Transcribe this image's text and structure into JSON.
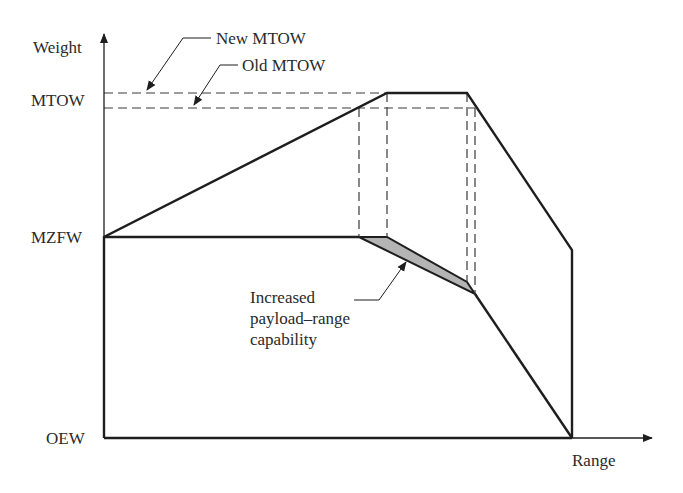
{
  "diagram": {
    "axes": {
      "y_label": "Weight",
      "x_label": "Range",
      "y_ticks": [
        "MTOW",
        "MZFW",
        "OEW"
      ]
    },
    "annotations": {
      "new_mtow": "New MTOW",
      "old_mtow": "Old MTOW",
      "increased_lines": [
        "Increased",
        "payload–range",
        "capability"
      ]
    },
    "colors": {
      "line": "#1e1e1e",
      "shade": "#b4b4b4",
      "dash": "#3a3a3a"
    }
  }
}
